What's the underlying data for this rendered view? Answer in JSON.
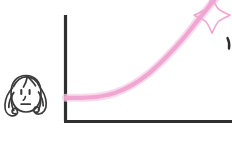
{
  "canvas": {
    "width": 232,
    "height": 147,
    "background": "#ffffff",
    "style": "hand-drawn-sketch"
  },
  "character": {
    "name": "woman-face-sketch",
    "description": "hand-drawn cartoon face of a woman with long wavy hair and a flat neutral mouth",
    "expression": "neutral-worried",
    "stroke_color": "#3a3a3a",
    "parts": [
      "head-outline",
      "hair-left-wave",
      "hair-right-wave",
      "hair-left-curl",
      "hair-right-curl",
      "bangs",
      "left-eye",
      "right-eye",
      "nose",
      "mouth"
    ]
  },
  "chart_data": {
    "type": "line",
    "title": "",
    "xlabel": "",
    "ylabel": "",
    "grid": false,
    "legend": null,
    "axis_color": "#2f2f2f",
    "series": [
      {
        "name": "growth-curve",
        "color": "#f0a6d0",
        "x": [
          0,
          10,
          20,
          30,
          40,
          50,
          60,
          70,
          80,
          90,
          100
        ],
        "y": [
          18,
          18,
          19,
          22,
          28,
          37,
          49,
          63,
          79,
          95,
          112
        ]
      }
    ],
    "xlim": [
      0,
      100
    ],
    "ylim": [
      0,
      100
    ],
    "annotations": [
      {
        "name": "sparkle",
        "symbol": "four-point-star",
        "x": 88,
        "y": 82,
        "color": "#f0a6d0"
      },
      {
        "name": "edge-mark",
        "symbol": "dot",
        "x": 99,
        "y": 68,
        "color": "#2b2b2b"
      }
    ]
  },
  "colors": {
    "curve_pink": "#f0a6d0",
    "curve_pink_light": "#f7cde6",
    "axis_dark": "#2f2f2f",
    "sketch_ink": "#3a3a3a",
    "background": "#ffffff"
  },
  "labels": {
    "alt_text": "Sketch of a woman beside a rising pink growth curve with a sparkle"
  }
}
